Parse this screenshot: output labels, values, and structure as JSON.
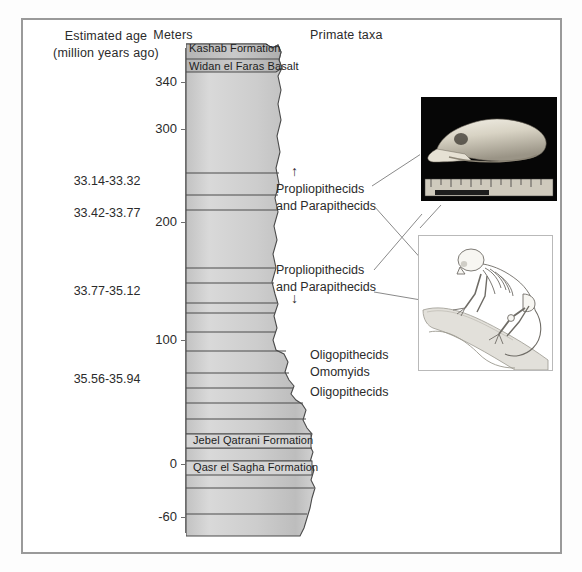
{
  "figure": {
    "headers": {
      "age_line1": "Estimated age",
      "age_line2": "(million years ago)",
      "meters": "Meters",
      "taxa": "Primate taxa"
    },
    "axis": {
      "unit": "Meters",
      "ticks": [
        {
          "label": "340",
          "value": 340,
          "y": 75
        },
        {
          "label": "300",
          "value": 300,
          "y": 122
        },
        {
          "label": "200",
          "value": 200,
          "y": 215
        },
        {
          "label": "100",
          "value": 100,
          "y": 333
        },
        {
          "label": "0",
          "value": 0,
          "y": 457
        },
        {
          "label": "-60",
          "value": -60,
          "y": 510
        }
      ]
    },
    "age_labels": [
      {
        "text": "33.14-33.32",
        "y": 180
      },
      {
        "text": "33.42-33.77",
        "y": 212
      },
      {
        "text": "33.77-35.12",
        "y": 290
      },
      {
        "text": "35.56-35.94",
        "y": 378
      }
    ],
    "formations": [
      {
        "name": "Kashab Formation",
        "id": "kashab"
      },
      {
        "name": "Widan el Faras Basalt",
        "id": "widan"
      },
      {
        "name": "Jebel Qatrani Formation",
        "id": "jebel"
      },
      {
        "name": "Qasr el Sagha Formation",
        "id": "qasr"
      }
    ],
    "taxa_annotations": [
      {
        "id": "taxa-1",
        "line1": "Propliopithecids",
        "line2": "and Parapithecids",
        "marker": "↑"
      },
      {
        "id": "taxa-2",
        "line1": "Propliopithecids",
        "line2": "and Parapithecids",
        "marker": "↓"
      },
      {
        "id": "taxa-3",
        "line1": "Oligopithecids",
        "line2": "Omomyids"
      },
      {
        "id": "taxa-4",
        "line1": "Oligopithecids",
        "line2": ""
      }
    ],
    "insets": [
      {
        "id": "skull",
        "caption": "fossil primate skull photograph with millimeter ruler scale"
      },
      {
        "id": "skeleton",
        "caption": "primate skeleton illustration on tree branch"
      }
    ],
    "colors": {
      "frame": "#9a9a9a",
      "column_fill": "#cfcfcf",
      "column_stroke": "#4a4a4a",
      "text": "#2b2b2b",
      "leader": "#8c8c8c",
      "photo_bg": "#050505"
    }
  }
}
